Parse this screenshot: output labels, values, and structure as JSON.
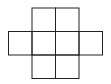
{
  "diagram": {
    "type": "grid-net",
    "cell_size": 23.5,
    "stroke_color": "#222222",
    "background": "#ffffff",
    "cells": [
      {
        "row": 0,
        "col": 1
      },
      {
        "row": 0,
        "col": 2
      },
      {
        "row": 1,
        "col": 0
      },
      {
        "row": 1,
        "col": 1
      },
      {
        "row": 1,
        "col": 2
      },
      {
        "row": 1,
        "col": 3
      },
      {
        "row": 2,
        "col": 1
      },
      {
        "row": 2,
        "col": 2
      }
    ]
  }
}
